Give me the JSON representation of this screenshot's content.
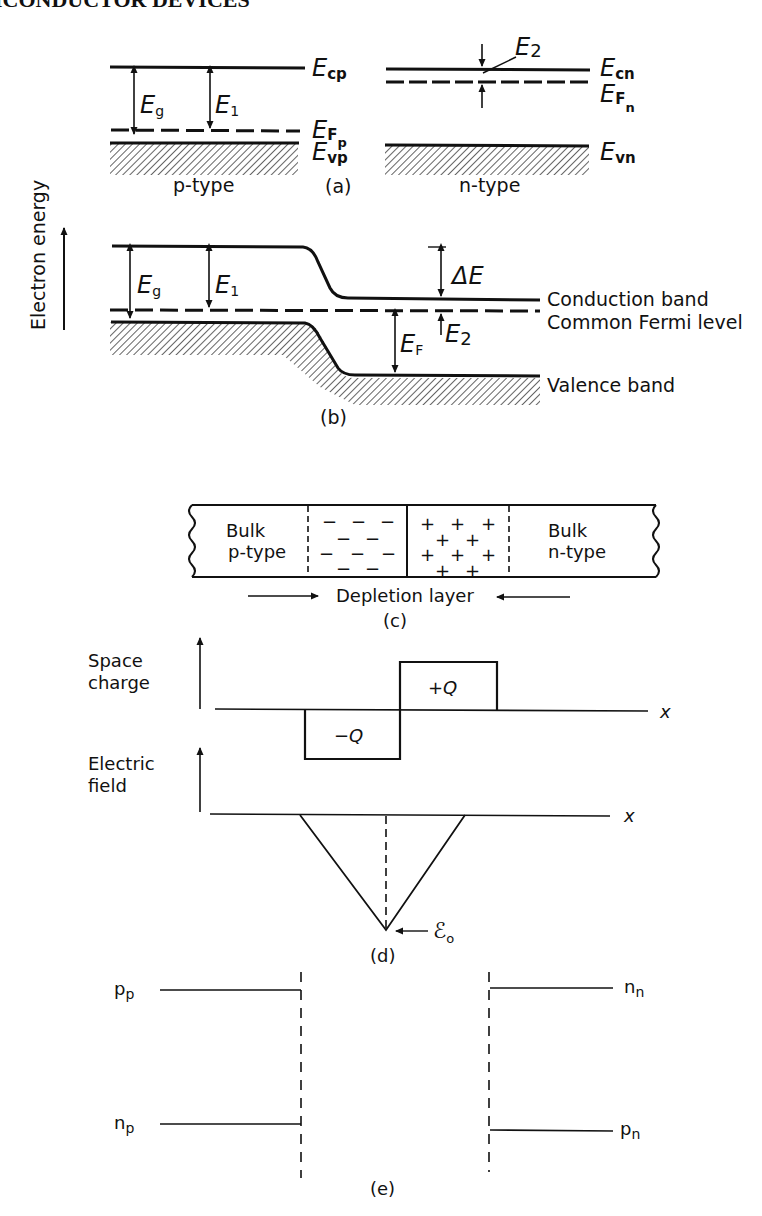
{
  "page": {
    "running_header": "ICONDUCTOR DEVICES"
  },
  "axis": {
    "electron_energy": "Electron energy"
  },
  "panel_a": {
    "caption": "(a)",
    "p_type": {
      "label": "p-type",
      "conduction": {
        "main": "E",
        "sub": "cp"
      },
      "fermi": {
        "main": "E",
        "sub": "F",
        "subsub": "p"
      },
      "valence": {
        "main": "E",
        "sub": "vp"
      },
      "gap_arrow": {
        "main": "E",
        "sub": "g"
      },
      "e1_arrow": {
        "main": "E",
        "sub": "1"
      }
    },
    "n_type": {
      "label": "n-type",
      "conduction": {
        "main": "E",
        "sub": "cn"
      },
      "fermi": {
        "main": "E",
        "sub": "F",
        "subsub": "n"
      },
      "valence": {
        "main": "E",
        "sub": "vn"
      },
      "e2_arrow": {
        "main": "E",
        "sub": "2"
      }
    }
  },
  "panel_b": {
    "caption": "(b)",
    "gap_arrow": {
      "main": "E",
      "sub": "g"
    },
    "e1_arrow": {
      "main": "E",
      "sub": "1"
    },
    "delta_e": "ΔE",
    "ef_arrow": {
      "main": "E",
      "sub": "F"
    },
    "e2_arrow": {
      "main": "E",
      "sub": "2"
    },
    "conduction_band": "Conduction band",
    "common_fermi_level": "Common Fermi level",
    "valence_band": "Valence band"
  },
  "panel_c": {
    "caption": "(c)",
    "bulk_p_line1": "Bulk",
    "bulk_p_line2": "p-type",
    "bulk_n_line1": "Bulk",
    "bulk_n_line2": "n-type",
    "negative_charge": "−",
    "positive_charge": "+",
    "depletion_layer": "Depletion layer"
  },
  "panel_d": {
    "caption": "(d)",
    "space_charge_line1": "Space",
    "space_charge_line2": "charge",
    "electric_field_line1": "Electric",
    "electric_field_line2": "field",
    "plus_q": "+Q",
    "minus_q": "−Q",
    "x_axis_1": "x",
    "x_axis_2": "x",
    "peak_field": {
      "main": "ℰ",
      "sub": "o"
    }
  },
  "panel_e": {
    "caption": "(e)",
    "pp": {
      "main": "p",
      "sub": "p"
    },
    "np": {
      "main": "n",
      "sub": "p"
    },
    "nn": {
      "main": "n",
      "sub": "n"
    },
    "pn": {
      "main": "p",
      "sub": "n"
    }
  }
}
